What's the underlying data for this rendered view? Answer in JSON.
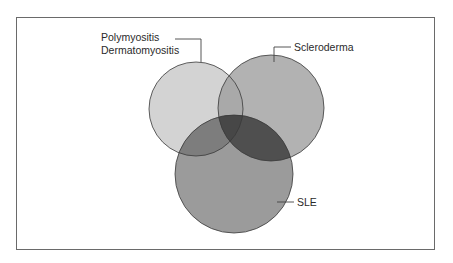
{
  "diagram": {
    "type": "venn",
    "sets": [
      {
        "id": "polymyositis",
        "label_lines": [
          "Polymyositis",
          "Dermatomyositis"
        ],
        "cx": 196,
        "cy": 109,
        "r": 47,
        "color": "#d3d3d3"
      },
      {
        "id": "scleroderma",
        "label_lines": [
          "Scleroderma"
        ],
        "cx": 271,
        "cy": 108,
        "r": 53,
        "color": "#b2b2b2"
      },
      {
        "id": "sle",
        "label_lines": [
          "SLE"
        ],
        "cx": 234,
        "cy": 174,
        "r": 59,
        "color": "#9b9b9b"
      }
    ],
    "intersections": {
      "polymyositis_scleroderma": "#a9a9a9",
      "polymyositis_sle": "#7d7d7d",
      "scleroderma_sle": "#4f4f4f",
      "all_three": "#474747"
    },
    "stroke_color": "#3a3a3a",
    "frame_border_color": "#6a6a6a"
  },
  "labels": {
    "polymyositis_line1": "Polymyositis",
    "polymyositis_line2": "Dermatomyositis",
    "scleroderma": "Scleroderma",
    "sle": "SLE"
  }
}
